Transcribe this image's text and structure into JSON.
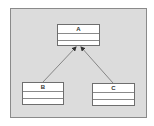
{
  "diagram": {
    "type": "uml-class-diagram",
    "classes": [
      {
        "id": "A",
        "name": "A",
        "compartments": [
          "",
          ""
        ]
      },
      {
        "id": "B",
        "name": "B",
        "compartments": [
          "",
          ""
        ]
      },
      {
        "id": "C",
        "name": "C",
        "compartments": [
          "",
          ""
        ]
      }
    ],
    "relationships": [
      {
        "from": "B",
        "to": "A",
        "type": "association",
        "arrowhead": "filled"
      },
      {
        "from": "C",
        "to": "A",
        "type": "association",
        "arrowhead": "filled"
      }
    ],
    "colors": {
      "canvas": "#dcdcdc",
      "box": "#ffffff",
      "line": "#6e6e6e"
    }
  }
}
